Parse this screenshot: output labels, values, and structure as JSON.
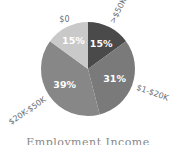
{
  "chart_data": {
    "type": "pie",
    "title": "Employment Income",
    "start": "top",
    "direction": "clockwise",
    "slices": [
      {
        "label": ">$50K",
        "value": 15,
        "display": "15%",
        "color": "#4a4a4a"
      },
      {
        "label": "$1-$20K",
        "value": 31,
        "display": "31%",
        "color": "#7a7a7a"
      },
      {
        "label": "$20K-$50K",
        "value": 39,
        "display": "39%",
        "color": "#878787"
      },
      {
        "label": "$0",
        "value": 15,
        "display": "15%",
        "color": "#c9c9c9"
      }
    ]
  }
}
